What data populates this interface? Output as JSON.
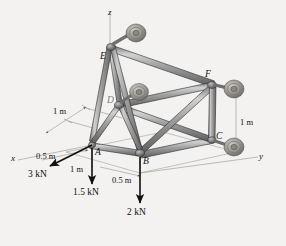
{
  "figure": {
    "type": "engineering-statics-3d-truss"
  },
  "axes": [
    {
      "name": "x-axis",
      "label": "x"
    },
    {
      "name": "y-axis",
      "label": "y"
    },
    {
      "name": "z-axis",
      "label": "z"
    }
  ],
  "joints": [
    {
      "id": "A",
      "label": "A"
    },
    {
      "id": "B",
      "label": "B"
    },
    {
      "id": "C",
      "label": "C"
    },
    {
      "id": "D",
      "label": "D"
    },
    {
      "id": "E",
      "label": "E"
    },
    {
      "id": "F",
      "label": "F"
    }
  ],
  "dimensions": [
    {
      "id": "left-1m",
      "label": "1 m"
    },
    {
      "id": "right-1m",
      "label": "1 m"
    },
    {
      "id": "x-0_5m",
      "label": "0.5 m"
    },
    {
      "id": "a-1m",
      "label": "1 m"
    },
    {
      "id": "b-0_5m",
      "label": "0.5 m"
    }
  ],
  "forces": [
    {
      "id": "force-3kN",
      "label": "3 kN",
      "at": "A",
      "direction": "-x"
    },
    {
      "id": "force-1_5kN",
      "label": "1.5 kN",
      "at": "A",
      "direction": "-z"
    },
    {
      "id": "force-2kN",
      "label": "2 kN",
      "at": "B",
      "direction": "-z"
    }
  ],
  "supports": [
    {
      "id": "support-E",
      "type": "ball-and-socket"
    },
    {
      "id": "support-F",
      "type": "ball-and-socket"
    },
    {
      "id": "support-C",
      "type": "ball-and-socket"
    },
    {
      "id": "support-D",
      "type": "ball-and-socket"
    }
  ],
  "colors": {
    "member_fill": "#9a9a9a",
    "member_light": "#d8d8d8",
    "member_dark": "#5f5f5f",
    "outline": "#2b2b2b",
    "dimension_line": "#7d7d7d",
    "background": "#f3f2f0",
    "text": "#111111"
  },
  "background_text": {
    "line1": "",
    "line2": ""
  }
}
